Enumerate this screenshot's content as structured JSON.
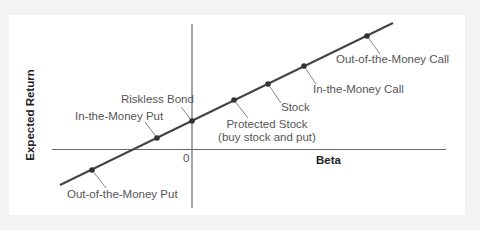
{
  "diagram": {
    "type": "line-with-markers",
    "title": "",
    "axes": {
      "x_label": "Beta",
      "y_label": "Expected Return",
      "origin_label": "0"
    },
    "line": {
      "description": "Security market line through option/stock positions"
    },
    "points": [
      {
        "id": "otm-put",
        "label": "Out-of-the-Money Put"
      },
      {
        "id": "itm-put",
        "label": "In-the-Money Put"
      },
      {
        "id": "riskless",
        "label": "Riskless Bond"
      },
      {
        "id": "protected",
        "label": "Protected Stock",
        "sublabel": "(buy stock and put)"
      },
      {
        "id": "stock",
        "label": "Stock"
      },
      {
        "id": "itm-call",
        "label": "In-the-Money Call"
      },
      {
        "id": "otm-call",
        "label": "Out-of-the-Money Call"
      }
    ],
    "colors": {
      "line": "#444444",
      "axis": "#666666",
      "leader": "#777777",
      "marker": "#333333",
      "label": "#555555",
      "background": "#f3f3f3",
      "panel": "#ffffff"
    }
  }
}
